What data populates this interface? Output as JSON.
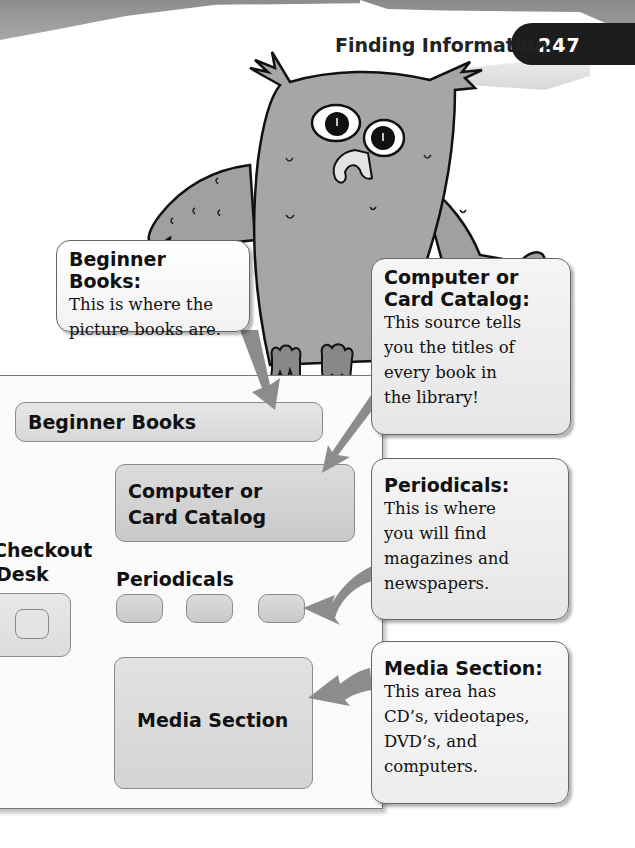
{
  "header": {
    "title": "Finding Information",
    "page_number": "247"
  },
  "illustration": {
    "subject": "owl",
    "description": "Gray cartoon owl peeking over the library map"
  },
  "map": {
    "rooms": [
      {
        "id": "beginner-books",
        "label": "Beginner Books"
      },
      {
        "id": "card-catalog",
        "label_line1": "Computer or",
        "label_line2": "Card Catalog"
      },
      {
        "id": "checkout-desk",
        "label_line1": "Checkout",
        "label_line2": "Desk"
      },
      {
        "id": "periodicals",
        "label": "Periodicals"
      },
      {
        "id": "media-section",
        "label": "Media Section"
      }
    ]
  },
  "callouts": [
    {
      "id": "beginner-books",
      "title": "Beginner Books:",
      "lines": [
        "This is where the",
        "picture books are."
      ]
    },
    {
      "id": "card-catalog",
      "title_line1": "Computer or",
      "title_line2": "Card Catalog:",
      "lines": [
        "This source tells",
        "you the titles of",
        "every book in",
        "the library!"
      ]
    },
    {
      "id": "periodicals",
      "title": "Periodicals:",
      "lines": [
        "This is where",
        "you will find",
        "magazines and",
        "newspapers."
      ]
    },
    {
      "id": "media-section",
      "title": "Media Section:",
      "lines": [
        "This area has",
        "CD’s, videotapes,",
        "DVD’s, and",
        "computers."
      ]
    }
  ],
  "colors": {
    "banner": "#9a9a9a",
    "page_tab": "#1d1d1d",
    "room_fill": "#d0d0d0",
    "arrow": "#8c8c8c",
    "owl": "#9e9e9e"
  }
}
